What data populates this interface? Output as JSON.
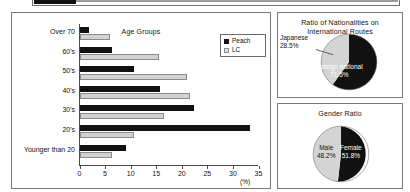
{
  "top_strip": {
    "note": "cut-off-element"
  },
  "bar_panel": {
    "title": "Age Groups",
    "legend": [
      {
        "label": "Peach",
        "color": "#111111",
        "swatch": "peach-swatch"
      },
      {
        "label": "LC",
        "color": "#d2d2d2",
        "swatch": "lc-swatch"
      }
    ],
    "axis_unit": "(%)",
    "xticks": [
      "0",
      "5",
      "10",
      "15",
      "20",
      "25",
      "30",
      "35"
    ],
    "ylabels": [
      "Over 70",
      "60's",
      "50's",
      "40's",
      "30's",
      "20's",
      "Younger than 20"
    ]
  },
  "nationality_panel": {
    "title_line1": "Ratio of Nationalities on",
    "title_line2": "International Routes",
    "japanese_label": "Japanese",
    "japanese_value": "28.5%",
    "foreign_label": "Foreign national",
    "foreign_value": "71.5%"
  },
  "gender_panel": {
    "title": "Gender Ratio",
    "male_label": "Male",
    "male_value": "48.2%",
    "female_label": "Female",
    "female_value": "51.8%"
  },
  "chart_data": [
    {
      "type": "bar",
      "orientation": "horizontal",
      "title": "Age Groups",
      "xlabel": "(%)",
      "ylabel": "",
      "xlim": [
        0,
        35
      ],
      "xticks": [
        0,
        5,
        10,
        15,
        20,
        25,
        30,
        35
      ],
      "grid": false,
      "legend_position": "top-right",
      "categories": [
        "Over 70",
        "60's",
        "50's",
        "40's",
        "30's",
        "20's",
        "Younger than 20"
      ],
      "series": [
        {
          "name": "Peach",
          "color": "#111111",
          "values": [
            1.8,
            6.3,
            10.6,
            15.7,
            22.4,
            33.4,
            9.1
          ]
        },
        {
          "name": "LC",
          "color": "#d2d2d2",
          "values": [
            6.0,
            15.5,
            21.0,
            21.7,
            16.5,
            10.6,
            6.3
          ]
        }
      ]
    },
    {
      "type": "pie",
      "title": "Ratio of Nationalities on International Routes",
      "labels": [
        "Foreign national",
        "Japanese"
      ],
      "values": [
        71.5,
        28.5
      ],
      "colors": [
        "#111111",
        "#d2d2d2"
      ],
      "legend_position": "none"
    },
    {
      "type": "pie",
      "title": "Gender Ratio",
      "labels": [
        "Female",
        "Male"
      ],
      "values": [
        51.8,
        48.2
      ],
      "colors": [
        "#111111",
        "#d2d2d2"
      ],
      "legend_position": "none"
    }
  ]
}
